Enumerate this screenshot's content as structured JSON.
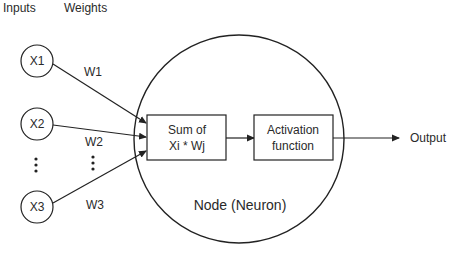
{
  "headers": {
    "inputs": "Inputs",
    "weights": "Weights"
  },
  "inputs": [
    {
      "label": "X1"
    },
    {
      "label": "X2"
    },
    {
      "label": "X3"
    }
  ],
  "weights": [
    {
      "label": "W1"
    },
    {
      "label": "W2"
    },
    {
      "label": "W3"
    }
  ],
  "ellipsis": "⋮",
  "node": {
    "label": "Node (Neuron)",
    "sum_box": {
      "line1": "Sum of",
      "line2": "Xi * Wj"
    },
    "activation_box": {
      "line1": "Activation",
      "line2": "function"
    }
  },
  "output": {
    "label": "Output"
  },
  "colors": {
    "stroke": "#222222",
    "text": "#2a2a2a",
    "background": "#ffffff"
  }
}
